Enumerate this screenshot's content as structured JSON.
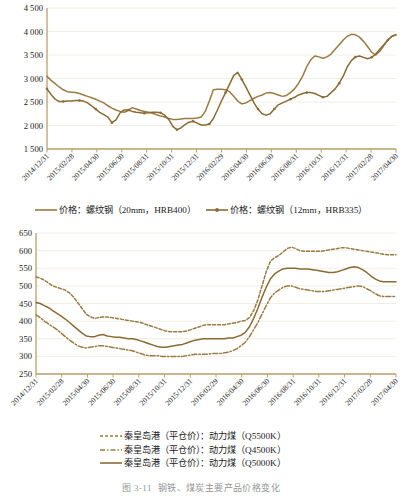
{
  "figure": {
    "caption_number": "图 3-11",
    "caption_text": "钢铁、煤炭主要产品价格变化"
  },
  "colors": {
    "series_brown": "#9a7b42",
    "series_brown_dark": "#8a6b33",
    "gridline": "#f3eee2",
    "axis": "#b9a06a",
    "text": "#1a1a1a"
  },
  "chart_data": [
    {
      "id": "steel-price-chart",
      "type": "line",
      "title": "",
      "xlabel": "",
      "ylabel": "",
      "ylim": [
        1500,
        4500
      ],
      "ystep": 500,
      "grid": true,
      "legend_position": "bottom",
      "ytick_labels": [
        "1 500",
        "2 000",
        "2 500",
        "3 000",
        "3 500",
        "4 000",
        "4 500"
      ],
      "categories": [
        "2014/12/31",
        "2015/02/28",
        "2015/04/30",
        "2015/06/30",
        "2015/08/31",
        "2015/10/31",
        "2015/12/31",
        "2016/02/29",
        "2016/04/30",
        "2016/06/30",
        "2016/08/31",
        "2016/10/31",
        "2016/12/31",
        "2017/02/28",
        "2017/04/30"
      ],
      "series": [
        {
          "name": "价格：螺纹钢（20mm，HRB400）",
          "style": "solid",
          "marker": "none",
          "color": "#9a7b42",
          "values": [
            3050,
            2960,
            2890,
            2820,
            2760,
            2720,
            2710,
            2700,
            2680,
            2650,
            2620,
            2590,
            2560,
            2520,
            2480,
            2420,
            2370,
            2330,
            2300,
            2280,
            2320,
            2380,
            2350,
            2320,
            2300,
            2280,
            2260,
            2230,
            2200,
            2180,
            2150,
            2130,
            2130,
            2140,
            2150,
            2150,
            2150,
            2160,
            2180,
            2300,
            2520,
            2760,
            2770,
            2770,
            2760,
            2720,
            2620,
            2520,
            2460,
            2480,
            2530,
            2580,
            2620,
            2650,
            2690,
            2700,
            2680,
            2650,
            2620,
            2640,
            2700,
            2780,
            2900,
            3050,
            3250,
            3400,
            3480,
            3460,
            3430,
            3460,
            3520,
            3620,
            3720,
            3820,
            3900,
            3940,
            3930,
            3880,
            3790,
            3680,
            3560,
            3500,
            3580,
            3700,
            3820,
            3900,
            3930
          ]
        },
        {
          "name": "价格：螺纹钢（12mm，HRB335）",
          "style": "solid",
          "marker": "dot",
          "color": "#8a6b33",
          "values": [
            2780,
            2660,
            2560,
            2510,
            2510,
            2520,
            2520,
            2530,
            2530,
            2520,
            2480,
            2420,
            2350,
            2280,
            2230,
            2180,
            2060,
            2120,
            2270,
            2330,
            2330,
            2300,
            2280,
            2270,
            2260,
            2270,
            2280,
            2280,
            2270,
            2220,
            2130,
            1980,
            1910,
            1950,
            2020,
            2070,
            2090,
            2050,
            2010,
            2010,
            2030,
            2150,
            2330,
            2520,
            2700,
            2880,
            3060,
            3130,
            2980,
            2820,
            2650,
            2480,
            2350,
            2250,
            2220,
            2250,
            2350,
            2440,
            2480,
            2520,
            2560,
            2600,
            2650,
            2680,
            2700,
            2700,
            2680,
            2640,
            2600,
            2620,
            2700,
            2780,
            2900,
            3050,
            3250,
            3380,
            3460,
            3480,
            3450,
            3420,
            3450,
            3520,
            3620,
            3720,
            3820,
            3900,
            3930
          ]
        }
      ]
    },
    {
      "id": "coal-price-chart",
      "type": "line",
      "title": "",
      "xlabel": "",
      "ylabel": "",
      "ylim": [
        250,
        650
      ],
      "ystep": 50,
      "grid": true,
      "legend_position": "bottom",
      "ytick_labels": [
        "250",
        "300",
        "350",
        "400",
        "450",
        "500",
        "550",
        "600",
        "650"
      ],
      "categories": [
        "2014/12/31",
        "2015/02/28",
        "2015/04/30",
        "2015/06/30",
        "2015/08/31",
        "2015/10/31",
        "2015/12/31",
        "2016/02/29",
        "2016/04/30",
        "2016/06/30",
        "2016/08/31",
        "2016/10/31",
        "2016/12/31",
        "2017/02/28",
        "2017/04/30"
      ],
      "series": [
        {
          "name": "秦皇岛港（平仓价）：动力煤（Q5500K）",
          "style": "dashed",
          "marker": "none",
          "color": "#9a7b42",
          "values": [
            525,
            522,
            516,
            508,
            500,
            496,
            492,
            488,
            480,
            468,
            452,
            436,
            420,
            412,
            408,
            410,
            412,
            412,
            410,
            408,
            406,
            404,
            402,
            400,
            398,
            396,
            392,
            388,
            384,
            380,
            376,
            372,
            370,
            370,
            370,
            370,
            372,
            376,
            380,
            384,
            388,
            390,
            390,
            390,
            390,
            390,
            392,
            394,
            396,
            400,
            402,
            410,
            430,
            460,
            500,
            540,
            570,
            580,
            586,
            596,
            606,
            610,
            606,
            600,
            598,
            598,
            598,
            598,
            598,
            600,
            602,
            604,
            606,
            608,
            608,
            606,
            604,
            602,
            600,
            598,
            596,
            594,
            592,
            590,
            588,
            588,
            588
          ]
        },
        {
          "name": "秦皇岛港（平仓价）：动力煤（Q4500K）",
          "style": "dashdot",
          "marker": "none",
          "color": "#9a7b42",
          "values": [
            418,
            410,
            400,
            392,
            384,
            376,
            366,
            356,
            346,
            338,
            330,
            326,
            324,
            326,
            328,
            330,
            330,
            328,
            326,
            324,
            322,
            320,
            318,
            316,
            312,
            308,
            304,
            302,
            302,
            302,
            300,
            300,
            300,
            300,
            300,
            300,
            302,
            304,
            306,
            306,
            306,
            306,
            308,
            308,
            308,
            310,
            312,
            316,
            322,
            330,
            340,
            356,
            376,
            396,
            420,
            444,
            466,
            480,
            488,
            496,
            500,
            500,
            496,
            492,
            490,
            488,
            486,
            484,
            484,
            484,
            486,
            488,
            490,
            492,
            494,
            496,
            498,
            500,
            498,
            492,
            486,
            478,
            472,
            470,
            470,
            470,
            470
          ]
        },
        {
          "name": "秦皇岛港（平仓价）：动力煤（Q5000K）",
          "style": "solid",
          "marker": "none",
          "color": "#8a6b33",
          "values": [
            453,
            450,
            444,
            438,
            430,
            422,
            414,
            406,
            396,
            386,
            376,
            366,
            358,
            356,
            356,
            360,
            362,
            358,
            356,
            354,
            354,
            352,
            350,
            350,
            348,
            344,
            340,
            336,
            332,
            328,
            326,
            326,
            328,
            330,
            332,
            334,
            338,
            342,
            346,
            348,
            350,
            350,
            350,
            350,
            350,
            350,
            352,
            352,
            356,
            360,
            368,
            384,
            408,
            436,
            468,
            496,
            520,
            534,
            542,
            548,
            550,
            550,
            550,
            548,
            548,
            548,
            546,
            544,
            542,
            540,
            538,
            538,
            540,
            544,
            548,
            552,
            554,
            552,
            546,
            538,
            528,
            520,
            514,
            512,
            512,
            512,
            512
          ]
        }
      ]
    }
  ]
}
